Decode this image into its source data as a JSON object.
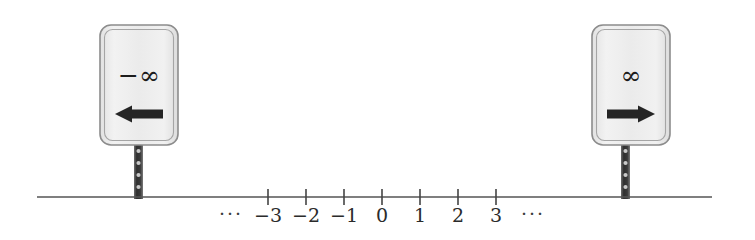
{
  "figure": {
    "background_color": "#ffffff",
    "width": 755,
    "height": 240
  },
  "number_line": {
    "axis_color": "#555555",
    "tick_color": "#444444",
    "label_color": "#2b2b2b",
    "baseline_y": 197,
    "x_start": 37,
    "x_end": 712,
    "tick_spacing": 38,
    "tick_half_height": 8,
    "ticks": [
      {
        "value": "-3",
        "label": "−3",
        "x": 268
      },
      {
        "value": "-2",
        "label": "−2",
        "x": 306
      },
      {
        "value": "-1",
        "label": "−1",
        "x": 344
      },
      {
        "value": "0",
        "label": "0",
        "x": 382
      },
      {
        "value": "1",
        "label": "1",
        "x": 420
      },
      {
        "value": "2",
        "label": "2",
        "x": 458
      },
      {
        "value": "3",
        "label": "3",
        "x": 496
      }
    ],
    "label_y": 222,
    "ellipsis_left": {
      "text": "···",
      "x": 231,
      "y": 220
    },
    "ellipsis_right": {
      "text": "···",
      "x": 533,
      "y": 220
    }
  },
  "signs": [
    {
      "id": "negative-infinity-sign",
      "symbol": "−∞",
      "symbol_name": "negative-infinity-symbol",
      "arrow_direction": "left",
      "arrow_name": "left-arrow-icon",
      "plate": {
        "x": 100,
        "y": 25,
        "width": 78,
        "height": 120,
        "radius": 11
      },
      "plate_fill": "#eeeeee",
      "plate_border": "#8c8c8c",
      "symbol_pos": {
        "x": 139,
        "y": 84
      },
      "arrow": {
        "cx": 139,
        "cy": 114,
        "length": 48,
        "shaft": 9,
        "head": 17
      },
      "post": {
        "x": 134,
        "y": 143,
        "width": 9,
        "height": 56
      },
      "post_color": "#3c3c3c"
    },
    {
      "id": "positive-infinity-sign",
      "symbol": "∞",
      "symbol_name": "positive-infinity-symbol",
      "arrow_direction": "right",
      "arrow_name": "right-arrow-icon",
      "plate": {
        "x": 592,
        "y": 25,
        "width": 78,
        "height": 120,
        "radius": 11
      },
      "plate_fill": "#eeeeee",
      "plate_border": "#8c8c8c",
      "symbol_pos": {
        "x": 631,
        "y": 84
      },
      "arrow": {
        "cx": 631,
        "cy": 114,
        "length": 48,
        "shaft": 9,
        "head": 17
      },
      "post": {
        "x": 621,
        "y": 143,
        "width": 9,
        "height": 56
      },
      "post_color": "#3c3c3c"
    }
  ],
  "post_holes": {
    "color": "#c9c9c9",
    "offsets": [
      8,
      20,
      32,
      44
    ]
  }
}
